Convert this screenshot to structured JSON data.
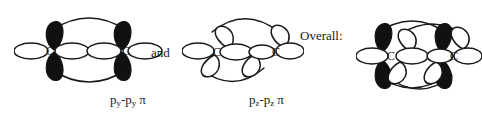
{
  "figure": {
    "background_color": "#ffffff",
    "ink_color": "#1a1a1a",
    "filled_lobe_color": "#111111",
    "open_lobe_color": "#ffffff"
  },
  "diagram_left": {
    "name": "py-py pi bond diagram",
    "atom_label_1": "C",
    "atom_label_2": "C",
    "caption_main": "p",
    "caption_sub_1": "y",
    "caption_dash": "-p",
    "caption_sub_2": "y",
    "caption_pi": "π",
    "caption_plain": "py-py π",
    "lobe_style": "filled-vertical-and-open-horizontal"
  },
  "connector": {
    "label": "and"
  },
  "diagram_middle": {
    "name": "pz-pz pi bond diagram",
    "atom_label_1": "C",
    "atom_label_2": "C",
    "caption_main": "p",
    "caption_sub_1": "z",
    "caption_dash": "-p",
    "caption_sub_2": "z",
    "caption_pi": "π",
    "caption_plain": "pz-pz π",
    "lobe_style": "all-open-tilted"
  },
  "overall": {
    "label": "Overall:"
  },
  "diagram_right": {
    "name": "overall combined pi system diagram",
    "atom_label_1": "C",
    "atom_label_2": "C",
    "lobe_style": "combined-filled-and-open"
  }
}
